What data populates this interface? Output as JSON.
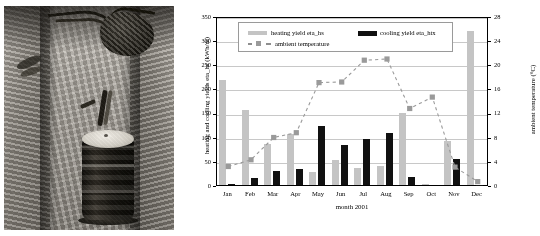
{
  "figure": {
    "photo_alt": "borehole heat exchanger head in excavated trench"
  },
  "chart_data": {
    "type": "bar",
    "title": "",
    "xlabel": "month 2001",
    "ylabel": "heating and cooling yields eta_hs (kWh/m)",
    "y2label": "ambient temperature (°C)",
    "categories": [
      "Jan",
      "Feb",
      "Mar",
      "Apr",
      "May",
      "Jun",
      "Jul",
      "Aug",
      "Sep",
      "Oct",
      "Nov",
      "Dec"
    ],
    "ylim": [
      0,
      350
    ],
    "yticks": [
      0,
      50,
      100,
      150,
      200,
      250,
      300,
      350
    ],
    "y2lim": [
      0,
      28
    ],
    "y2ticks": [
      0,
      4,
      8,
      12,
      16,
      20,
      24,
      28
    ],
    "grid": true,
    "legend_position": "top-center",
    "series": [
      {
        "name": "heating yield eta_hs",
        "type": "bar",
        "color": "#c4c4c4",
        "axis": "left",
        "values": [
          218,
          156,
          85,
          106,
          26,
          52,
          36,
          40,
          150,
          3,
          92,
          320
        ]
      },
      {
        "name": "cooling yield eta_htx",
        "type": "bar",
        "color": "#111111",
        "axis": "left",
        "values": [
          3,
          15,
          30,
          33,
          123,
          82,
          96,
          108,
          17,
          0,
          54,
          1
        ]
      },
      {
        "name": "ambient temperature",
        "type": "line",
        "style": "dashed",
        "marker": "square",
        "color": "#9a9a9a",
        "axis": "right",
        "values": [
          3.4,
          4.5,
          8.2,
          9.0,
          17.3,
          17.4,
          21.0,
          21.2,
          13.0,
          14.9,
          3.3,
          0.9
        ]
      }
    ],
    "extra_bars": {
      "note": "last category extends to",
      "value": 330
    }
  },
  "legend": {
    "items": [
      {
        "label": "heating yield eta_hs",
        "swatch": "grey-bar-swatch"
      },
      {
        "label": "cooling yield eta_htx",
        "swatch": "black-bar-swatch"
      },
      {
        "label": "ambient temperature",
        "swatch": "dashed-line-square-marker"
      }
    ]
  }
}
